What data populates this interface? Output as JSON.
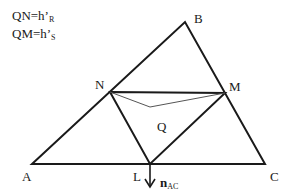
{
  "legend": {
    "line1": {
      "main": "QN=h’",
      "sub": "R"
    },
    "line2": {
      "main": "QM=h’",
      "sub": "S"
    }
  },
  "points": {
    "A": {
      "label": "A",
      "x": 32,
      "y": 164
    },
    "B": {
      "label": "B",
      "x": 185,
      "y": 22
    },
    "C": {
      "label": "C",
      "x": 265,
      "y": 164
    },
    "N": {
      "label": "N",
      "x": 110,
      "y": 92
    },
    "M": {
      "label": "M",
      "x": 225,
      "y": 93
    },
    "L": {
      "label": "L",
      "x": 150,
      "y": 164
    },
    "Q": {
      "label": "Q",
      "x": 150,
      "y": 107
    }
  },
  "normal_vector": {
    "main": "n",
    "sub": "AC"
  },
  "colors": {
    "stroke": "#1a1a1a",
    "thin_stroke": "#555555"
  }
}
